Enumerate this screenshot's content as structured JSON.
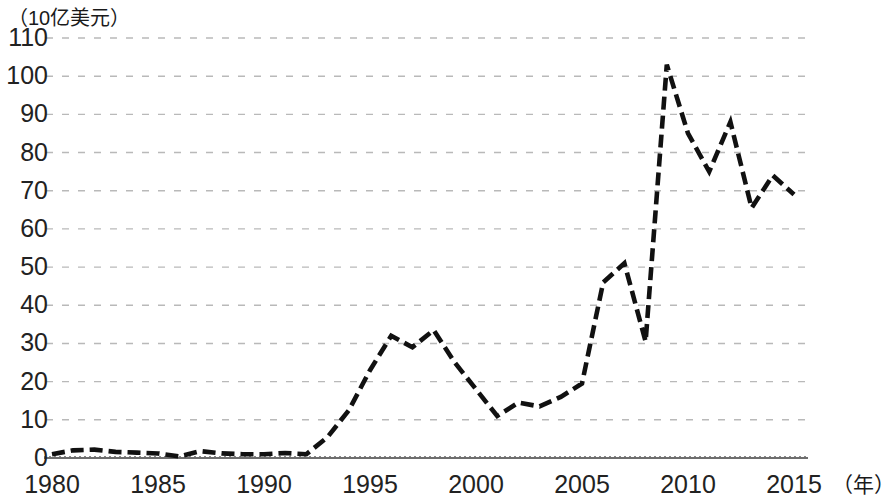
{
  "chart_data": {
    "type": "line",
    "title": "",
    "subtitle": "",
    "xlabel": "（年）",
    "ylabel": "（10亿美元）",
    "ylim": [
      0,
      110
    ],
    "xlim": [
      1980,
      2015
    ],
    "y_ticks": [
      0,
      10,
      20,
      30,
      40,
      50,
      60,
      70,
      80,
      90,
      100,
      110
    ],
    "y_tick_labels": [
      "0",
      "10",
      "20",
      "30",
      "40",
      "50",
      "60",
      "70",
      "80",
      "90",
      "100",
      "110"
    ],
    "x_ticks": [
      1980,
      1985,
      1990,
      1995,
      2000,
      2005,
      2010,
      2015
    ],
    "x_tick_labels": [
      "1980",
      "1985",
      "1990",
      "1995",
      "2000",
      "2005",
      "2010",
      "2015"
    ],
    "grid": "horizontal-dashed",
    "legend": "none",
    "line_style": "dashed",
    "line_color": "#111111",
    "grid_color": "#b9b9b9",
    "axis_color": "#6e6e6e",
    "x": [
      1980,
      1981,
      1982,
      1983,
      1984,
      1985,
      1986,
      1987,
      1988,
      1989,
      1990,
      1991,
      1992,
      1993,
      1994,
      1995,
      1996,
      1997,
      1998,
      1999,
      2000,
      2001,
      2002,
      2003,
      2004,
      2005,
      2006,
      2007,
      2008,
      2009,
      2010,
      2011,
      2012,
      2013,
      2014,
      2015
    ],
    "values": [
      1.0,
      2.0,
      2.2,
      1.6,
      1.4,
      1.2,
      0.4,
      1.8,
      1.2,
      1.0,
      1.0,
      1.3,
      1.0,
      5.5,
      12.5,
      23.0,
      32.0,
      29.0,
      33.5,
      25.0,
      18.0,
      11.0,
      14.5,
      13.5,
      16.0,
      19.5,
      46.0,
      51.0,
      30.5,
      103.0,
      85.0,
      75.0,
      88.0,
      65.5,
      74.0,
      69.0
    ]
  },
  "axis": {
    "y_unit": "（10亿美元）",
    "x_unit": "（年）"
  }
}
